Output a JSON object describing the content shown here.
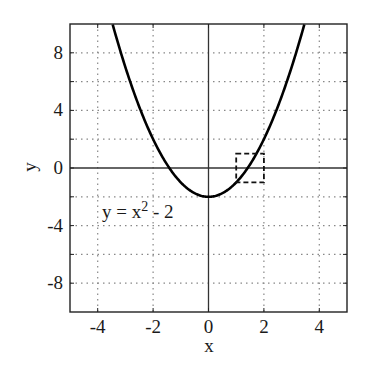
{
  "chart_data": {
    "type": "line",
    "title": "",
    "xlabel": "x",
    "ylabel": "y",
    "xlim": [
      -5,
      5
    ],
    "ylim": [
      -10,
      10
    ],
    "x_ticks": [
      -4,
      -2,
      0,
      2,
      4
    ],
    "x_tick_labels": [
      "-4",
      "-2",
      "0",
      "2",
      "4"
    ],
    "y_ticks": [
      -8,
      -6,
      -4,
      -2,
      0,
      2,
      4,
      6,
      8
    ],
    "y_tick_labels": [
      "-8",
      "",
      "-4",
      "",
      "0",
      "",
      "4",
      "",
      "8"
    ],
    "grid": true,
    "grid_style": "dotted",
    "axes_lines": {
      "x_axis_at_y": 0,
      "y_axis_at_x": 0
    },
    "series": [
      {
        "name": "y = x^2 - 2",
        "function": "x^2 - 2",
        "color": "#000000",
        "x": [
          -3.46,
          -3,
          -2.5,
          -2,
          -1.5,
          -1,
          -0.5,
          0,
          0.5,
          1,
          1.5,
          2,
          2.5,
          3,
          3.46
        ],
        "y": [
          9.97,
          7,
          4.25,
          2,
          0.25,
          -1,
          -1.75,
          -2,
          -1.75,
          -1,
          0.25,
          2,
          4.25,
          7,
          9.97
        ]
      }
    ],
    "annotations": [
      {
        "type": "text",
        "text": "y = x",
        "superscript": "2",
        "suffix": " - 2",
        "x": -3.8,
        "y": -3.3
      },
      {
        "type": "dashed_rect",
        "x0": 1,
        "x1": 2,
        "y0": -1,
        "y1": 1
      }
    ],
    "legend": null
  },
  "labels": {
    "xlabel": "x",
    "ylabel": "y",
    "equation_main": "y = x",
    "equation_sup": "2",
    "equation_tail": " - 2"
  }
}
